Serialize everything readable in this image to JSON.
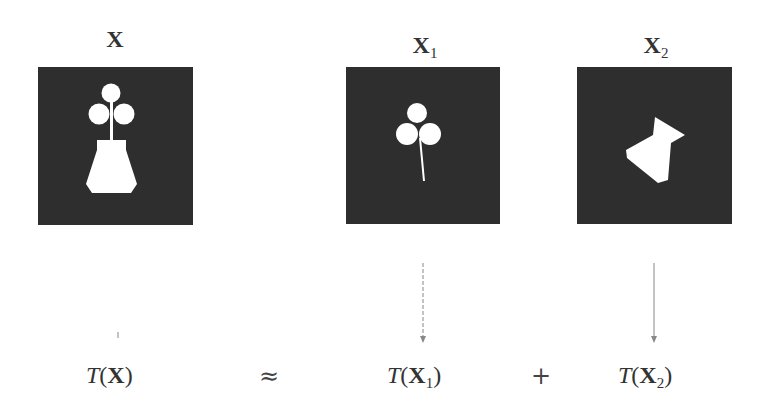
{
  "panels": [
    {
      "id": "X",
      "label_main": "X",
      "label_sub": "",
      "content": "vase-with-clover"
    },
    {
      "id": "X1",
      "label_main": "X",
      "label_sub": "1",
      "content": "clover"
    },
    {
      "id": "X2",
      "label_main": "X",
      "label_sub": "2",
      "content": "vase-polygon"
    }
  ],
  "equation": {
    "lhs": {
      "func": "T",
      "open": "(",
      "arg": "X",
      "sub": "",
      "close": ")"
    },
    "approx": "≈",
    "term1": {
      "func": "T",
      "open": "(",
      "arg": "X",
      "sub": "1",
      "close": ")"
    },
    "plus": "+",
    "term2": {
      "func": "T",
      "open": "(",
      "arg": "X",
      "sub": "2",
      "close": ")"
    }
  },
  "colors": {
    "panel_bg": "#2e2e2e",
    "shape_fill": "#ffffff",
    "arrow": "#888888"
  }
}
